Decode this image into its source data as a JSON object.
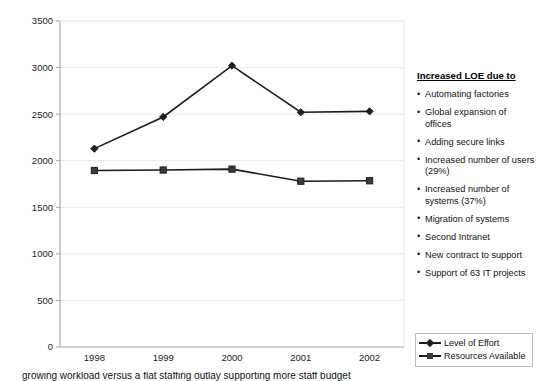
{
  "chart_data": {
    "type": "line",
    "title": "",
    "xlabel": "",
    "ylabel": "",
    "categories": [
      "1998",
      "1999",
      "2000",
      "2001",
      "2002"
    ],
    "ylim": [
      0,
      3500
    ],
    "ytick_step": 500,
    "yticks": [
      "0",
      "500",
      "1000",
      "1500",
      "2000",
      "2500",
      "3000",
      "3500"
    ],
    "grid": true,
    "legend_position": "bottom-right",
    "series": [
      {
        "name": "Level of Effort",
        "marker": "diamond",
        "color": "#1f1f1f",
        "values": [
          2130,
          2470,
          3020,
          2520,
          2530
        ]
      },
      {
        "name": "Resources Available",
        "marker": "square",
        "color": "#3a3a3a",
        "values": [
          1895,
          1900,
          1910,
          1780,
          1785
        ]
      }
    ]
  },
  "annotations": {
    "title": "Increased LOE due to",
    "items": [
      "Automating factories",
      "Global expansion of offices",
      "Adding secure links",
      "Increased number of users (29%)",
      "Increased number of systems (37%)",
      "Migration of systems",
      "Second Intranet",
      "New contract to support",
      "Support of 63 IT projects"
    ]
  },
  "caption": {
    "text": "growing workload versus a flat staffing outlay supporting more staff budget"
  },
  "colors": {
    "gridline": "#e9e9e9",
    "axis": "#a6a6a6",
    "series_loe": "#1f1f1f",
    "series_resources": "#3a3a3a"
  }
}
